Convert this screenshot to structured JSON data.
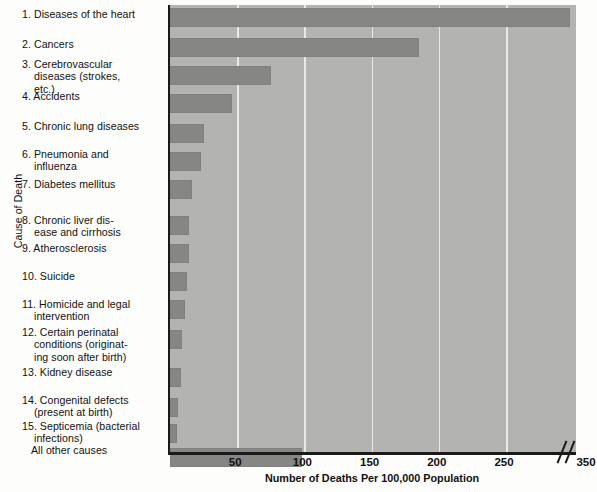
{
  "chart_data": {
    "type": "bar",
    "orientation": "horizontal",
    "title": "",
    "xlabel": "Number of Deaths Per 100,000 Population",
    "ylabel": "Cause of Death",
    "xlim": [
      0,
      350
    ],
    "xticks": [
      50,
      100,
      150,
      200,
      250,
      350
    ],
    "xtick_labels": [
      "50",
      "100",
      "150",
      "200",
      "250",
      "350"
    ],
    "axis_break": true,
    "axis_break_note": "//",
    "grid": "vertical gridlines at 50,100,150,200,250",
    "legend": "none",
    "categories": [
      "1. Diseases of the heart",
      "2. Cancers",
      "3. Cerebrovascular diseases (strokes, etc.)",
      "4. Accidents",
      "5. Chronic lung diseases",
      "6. Pneumonia and influenza",
      "7. Diabetes mellitus",
      "8. Chronic liver disease and cirrhosis",
      "9. Atherosclerosis",
      "10. Suicide",
      "11. Homicide and legal intervention",
      "12. Certain perinatal conditions (originating soon after birth)",
      "13. Kidney disease",
      "14. Congenital defects (present at birth)",
      "15. Septicemia (bacterial infections)",
      "All other causes"
    ],
    "values": [
      300,
      185,
      75,
      46,
      25,
      23,
      16,
      14,
      14,
      13,
      11,
      9,
      8,
      6,
      5,
      98
    ]
  },
  "axis": {
    "y_title": "Cause of Death",
    "x_title": "Number of Deaths Per 100,000 Population"
  },
  "labels": [
    {
      "id": "heart",
      "l1": "1. Diseases of the heart",
      "l2": "",
      "l3": ""
    },
    {
      "id": "cancers",
      "l1": "2. Cancers",
      "l2": "",
      "l3": ""
    },
    {
      "id": "cerebro",
      "l1": "3. Cerebrovascular",
      "l2": "diseases (strokes,",
      "l3": "etc.)"
    },
    {
      "id": "accidents",
      "l1": "4. Accidents",
      "l2": "",
      "l3": ""
    },
    {
      "id": "lung",
      "l1": "5. Chronic lung diseases",
      "l2": "",
      "l3": ""
    },
    {
      "id": "pneumonia",
      "l1": "6. Pneumonia and",
      "l2": "influenza",
      "l3": ""
    },
    {
      "id": "diabetes",
      "l1": "7. Diabetes mellitus",
      "l2": "",
      "l3": ""
    },
    {
      "id": "liver",
      "l1": "8. Chronic liver dis-",
      "l2": "ease and cirrhosis",
      "l3": ""
    },
    {
      "id": "athero",
      "l1": "9. Atherosclerosis",
      "l2": "",
      "l3": ""
    },
    {
      "id": "suicide",
      "l1": "10. Suicide",
      "l2": "",
      "l3": ""
    },
    {
      "id": "homicide",
      "l1": "11. Homicide and legal",
      "l2": "intervention",
      "l3": ""
    },
    {
      "id": "perinatal",
      "l1": "12. Certain perinatal",
      "l2": "conditions (originat-",
      "l3": "ing soon after birth)"
    },
    {
      "id": "kidney",
      "l1": "13. Kidney disease",
      "l2": "",
      "l3": ""
    },
    {
      "id": "congenital",
      "l1": "14. Congenital defects",
      "l2": "(present at birth)",
      "l3": ""
    },
    {
      "id": "septicemia",
      "l1": "15. Septicemia (bacterial",
      "l2": "infections)",
      "l3": ""
    },
    {
      "id": "other",
      "l1": "All other causes",
      "l2": "",
      "l3": ""
    }
  ],
  "xticks": [
    {
      "label": "50"
    },
    {
      "label": "100"
    },
    {
      "label": "150"
    },
    {
      "label": "200"
    },
    {
      "label": "250"
    },
    {
      "label": "350"
    }
  ],
  "colors": {
    "bar": "#868684",
    "plot_background": "#b3b3b1",
    "gridline": "#e9e9e6",
    "axis": "#1a1a1a",
    "page_background": "#fdfdfb",
    "text": "#111111"
  }
}
